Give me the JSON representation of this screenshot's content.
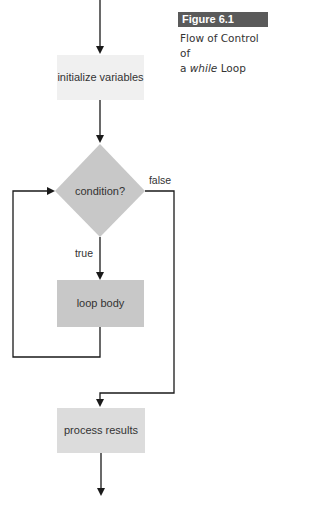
{
  "figure": {
    "number": "Figure 6.1",
    "caption_line1": "Flow of Control of",
    "caption_line2_prefix": "a ",
    "caption_line2_italic": "while",
    "caption_line2_suffix": " Loop",
    "badge_color": "#5a5a5a"
  },
  "nodes": {
    "init": {
      "label": "initialize variables",
      "fill": "#f0f0f0"
    },
    "condition": {
      "label": "condition?",
      "fill": "#c8c8c8"
    },
    "body": {
      "label": "loop body",
      "fill": "#c8c8c8"
    },
    "process": {
      "label": "process results",
      "fill": "#dcdcdc"
    }
  },
  "edges": {
    "true_label": "true",
    "false_label": "false",
    "line_color": "#1a1a1a"
  }
}
